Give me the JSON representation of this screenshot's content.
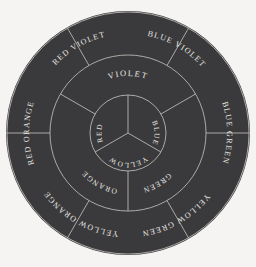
{
  "diagram": {
    "background_color": "#f5f4f2",
    "disk_color": "#3a3a3c",
    "line_color": "#b9b7b2",
    "text_color": "#e8e6e1",
    "center_x": 128,
    "center_y": 133,
    "radius_outer": 122,
    "radius_middle": 78,
    "radius_inner": 38
  },
  "rings": {
    "primary": {
      "name": "primary-colors",
      "labels": [
        "RED",
        "BLUE",
        "YELLOW"
      ]
    },
    "secondary": {
      "name": "secondary-colors",
      "labels": [
        "VIOLET",
        "GREEN",
        "ORANGE"
      ]
    },
    "tertiary": {
      "name": "tertiary-colors",
      "labels": [
        "RED VIOLET",
        "BLUE VIOLET",
        "BLUE GREEN",
        "YELLOW GREEN",
        "YELLOW ORANGE",
        "RED ORANGE"
      ]
    }
  },
  "labels": {
    "red": "RED",
    "blue": "BLUE",
    "yellow": "YELLOW",
    "violet": "VIOLET",
    "green": "GREEN",
    "orange": "ORANGE",
    "red_violet": "RED VIOLET",
    "blue_violet": "BLUE VIOLET",
    "blue_green": "BLUE GREEN",
    "yellow_green": "YELLOW GREEN",
    "yellow_orange": "YELLOW ORANGE",
    "red_orange": "RED ORANGE"
  }
}
